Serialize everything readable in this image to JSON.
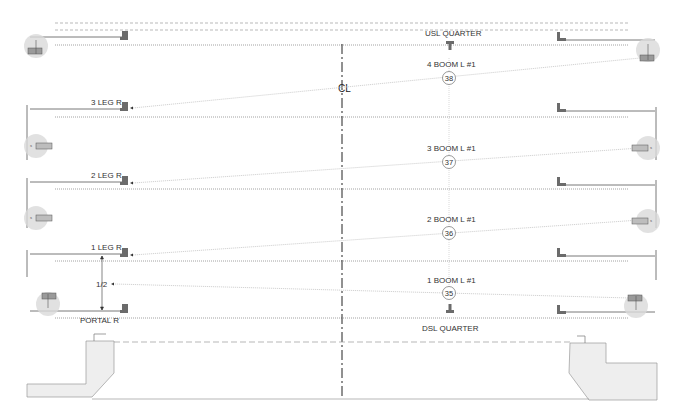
{
  "diagram": {
    "centerline_label": "CL",
    "colors": {
      "line": "#555555",
      "dotted": "#8a8a8a",
      "beam": "#c8c8c8",
      "fixture_fill": "#d9d9d9",
      "clamp": "#6b6b6b",
      "stage_fill": "#eeeeee",
      "stage_stroke": "#9a9a9a",
      "text": "#333333"
    },
    "positions": {
      "usl_quarter": "USL QUARTER",
      "dsl_quarter": "DSL QUARTER",
      "portal_r": "PORTAL R",
      "half_dim": "1/2"
    },
    "legs": [
      {
        "label": "3 LEG R",
        "y": 105
      },
      {
        "label": "2 LEG R",
        "y": 182
      },
      {
        "label": "1 LEG R",
        "y": 254
      }
    ],
    "booms": [
      {
        "label": "4 BOOM L #1",
        "unit": "38",
        "label_y": 64,
        "circle_y": 78
      },
      {
        "label": "3 BOOM L #1",
        "unit": "37",
        "label_y": 150,
        "circle_y": 162
      },
      {
        "label": "2 BOOM L #1",
        "unit": "36",
        "label_y": 220,
        "circle_y": 233
      },
      {
        "label": "1 BOOM L #1",
        "unit": "35",
        "label_y": 281,
        "circle_y": 293
      }
    ]
  }
}
